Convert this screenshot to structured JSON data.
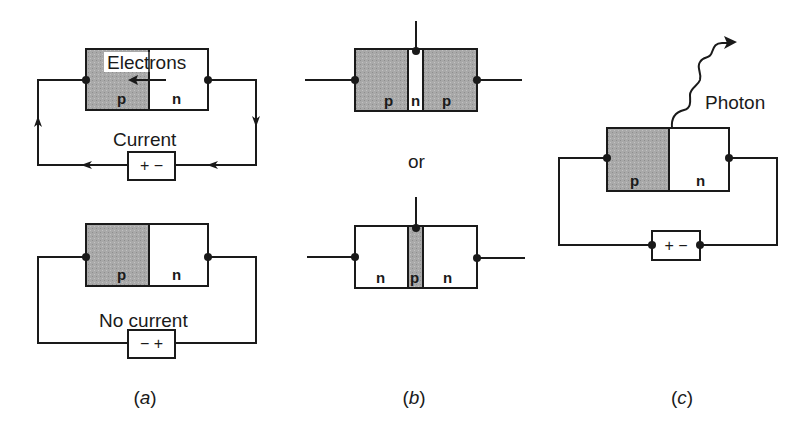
{
  "colors": {
    "p_region": "#a8a8a8",
    "n_region": "#ffffff",
    "line": "#1a1a1a"
  },
  "panel_a": {
    "caption_open": "(",
    "caption_letter": "a",
    "caption_close": ")",
    "forward": {
      "left_region": "p",
      "right_region": "n",
      "electrons_label": "Electrons",
      "current_label": "Current",
      "battery_label": "+ −"
    },
    "reverse": {
      "left_region": "p",
      "right_region": "n",
      "current_label": "No current",
      "battery_label": "− +"
    }
  },
  "panel_b": {
    "caption_open": "(",
    "caption_letter": "b",
    "caption_close": ")",
    "pnp": {
      "regions": [
        "p",
        "n",
        "p"
      ]
    },
    "or_label": "or",
    "npn": {
      "regions": [
        "n",
        "p",
        "n"
      ]
    }
  },
  "panel_c": {
    "caption_open": "(",
    "caption_letter": "c",
    "caption_close": ")",
    "left_region": "p",
    "right_region": "n",
    "photon_label": "Photon",
    "battery_label": "+ −"
  }
}
